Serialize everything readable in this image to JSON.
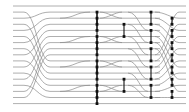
{
  "diagram": {
    "type": "sorting-network",
    "colors": {
      "background": "#ffffff",
      "wire": "#9a9a9a",
      "comparator": "#111111"
    },
    "rows": 17,
    "row_y_start": 6,
    "row_spacing": 6.1,
    "wire_x_start": 13,
    "wire_x_end": 186,
    "full_width_rows": [
      0,
      16
    ],
    "left_permutation": [
      [
        1,
        9
      ],
      [
        2,
        1
      ],
      [
        3,
        10
      ],
      [
        4,
        2
      ],
      [
        5,
        11
      ],
      [
        6,
        3
      ],
      [
        7,
        12
      ],
      [
        8,
        4
      ],
      [
        9,
        13
      ],
      [
        10,
        5
      ],
      [
        11,
        14
      ],
      [
        12,
        6
      ],
      [
        13,
        15
      ],
      [
        14,
        7
      ],
      [
        15,
        8
      ]
    ],
    "right_permutation": [
      [
        1,
        2
      ],
      [
        2,
        4
      ],
      [
        3,
        6
      ],
      [
        4,
        8
      ],
      [
        5,
        10
      ],
      [
        6,
        12
      ],
      [
        7,
        14
      ],
      [
        8,
        1
      ],
      [
        9,
        3
      ],
      [
        10,
        5
      ],
      [
        11,
        7
      ],
      [
        12,
        9
      ],
      [
        13,
        11
      ],
      [
        14,
        13
      ],
      [
        15,
        15
      ]
    ],
    "columns": [
      {
        "x": 97,
        "comparators": [
          [
            1,
            3
          ],
          [
            2,
            4
          ],
          [
            5,
            7
          ],
          [
            6,
            8
          ],
          [
            9,
            11
          ],
          [
            10,
            12
          ],
          [
            13,
            15
          ],
          [
            14,
            16
          ]
        ],
        "trunk": [
          1,
          16
        ]
      },
      {
        "x": 124,
        "comparators": [
          [
            3,
            5
          ],
          [
            12,
            14
          ]
        ]
      },
      {
        "x": 151,
        "comparators": [
          [
            1,
            3
          ],
          [
            4,
            6
          ],
          [
            7,
            9
          ],
          [
            10,
            12
          ],
          [
            13,
            15
          ]
        ]
      },
      {
        "x": 172,
        "comparators": [
          [
            2,
            3
          ],
          [
            4,
            5
          ],
          [
            6,
            7
          ],
          [
            8,
            9
          ],
          [
            10,
            11
          ],
          [
            12,
            13
          ],
          [
            14,
            15
          ]
        ]
      }
    ]
  }
}
